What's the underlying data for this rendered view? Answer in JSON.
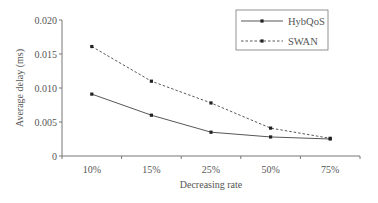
{
  "chart_data": {
    "type": "line",
    "title": "",
    "xlabel": "Decreasing rate",
    "ylabel": "Average delay (ms)",
    "categories": [
      "10%",
      "15%",
      "25%",
      "50%",
      "75%"
    ],
    "series": [
      {
        "name": "HybQoS",
        "style": "solid",
        "marker": "square",
        "values": [
          0.0091,
          0.006,
          0.0035,
          0.0028,
          0.0025
        ]
      },
      {
        "name": "SWAN",
        "style": "dashed",
        "marker": "square",
        "values": [
          0.0161,
          0.011,
          0.0078,
          0.0041,
          0.0026
        ]
      }
    ],
    "ylim": [
      0,
      0.02
    ],
    "yticks": [
      "0",
      "0.005",
      "0.010",
      "0.015",
      "0.020"
    ],
    "grid": false,
    "legend_position": "upper right"
  },
  "colors": {
    "line": "#444444",
    "text": "#555555"
  }
}
